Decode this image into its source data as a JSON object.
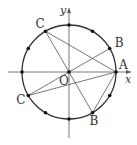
{
  "diagram": {
    "type": "unit-circle-geometry",
    "axes": {
      "x_label": "x",
      "y_label": "y",
      "origin_label": "O"
    },
    "circle": {
      "center": [
        69,
        72
      ],
      "radius": 47,
      "division_points": 12
    },
    "points": [
      {
        "id": "A",
        "label": "A",
        "angle_deg": 0
      },
      {
        "id": "B1",
        "label": "B",
        "angle_deg": 30
      },
      {
        "id": "C1",
        "label": "C",
        "angle_deg": 120
      },
      {
        "id": "C2",
        "label": "C",
        "angle_deg": 210
      },
      {
        "id": "B2",
        "label": "B",
        "angle_deg": 300
      }
    ],
    "segments": [
      [
        "A",
        "C1"
      ],
      [
        "A",
        "C2"
      ],
      [
        "A",
        "B2"
      ],
      [
        "B1",
        "C2"
      ],
      [
        "C1",
        "B2"
      ]
    ],
    "colors": {
      "stroke": "#333333",
      "thin": "#555555",
      "background": "#ffffff"
    }
  }
}
